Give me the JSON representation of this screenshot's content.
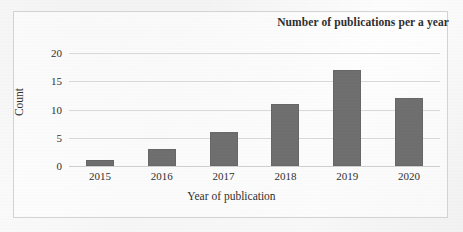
{
  "chart_data": {
    "type": "bar",
    "title": "Number of publications per a year",
    "xlabel": "Year of publication",
    "ylabel": "Count",
    "categories": [
      "2015",
      "2016",
      "2017",
      "2018",
      "2019",
      "2020"
    ],
    "values": [
      1,
      3,
      6,
      11,
      17,
      12
    ],
    "ylim": [
      0,
      20
    ],
    "ytick_labels": [
      "0",
      "5",
      "10",
      "15",
      "20"
    ],
    "ytick_values": [
      0,
      5,
      10,
      15,
      20
    ],
    "grid": "horizontal",
    "legend": "none",
    "bar_color": "#6e6e6e",
    "gridline_color": "#d9d9d9",
    "frame_color": "#d3d3d3",
    "text_color": "#2f2f2f"
  }
}
